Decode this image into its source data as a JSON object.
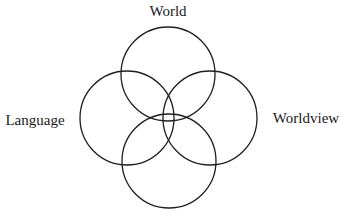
{
  "diagram": {
    "type": "four-circle overlapping venn diagram",
    "labels": {
      "top": "World",
      "left": "Language",
      "right": "Worldview",
      "bottom": ""
    },
    "circles": [
      {
        "id": "top",
        "label": "World",
        "cx": 168,
        "cy": 74,
        "r": 47
      },
      {
        "id": "left",
        "label": "Language",
        "cx": 127,
        "cy": 118,
        "r": 47
      },
      {
        "id": "right",
        "label": "Worldview",
        "cx": 210,
        "cy": 118,
        "r": 47
      },
      {
        "id": "bottom",
        "label": "",
        "cx": 169,
        "cy": 161,
        "r": 47
      }
    ],
    "stroke_color": "#1f1f1f",
    "background_color": "#ffffff"
  }
}
